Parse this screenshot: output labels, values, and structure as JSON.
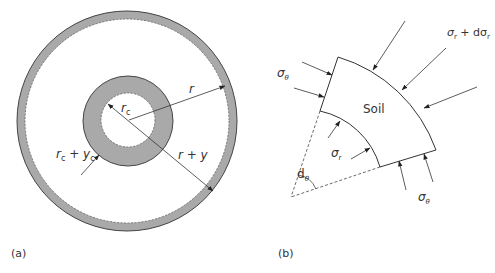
{
  "figure": {
    "panel_a": {
      "caption": "(a)",
      "labels": {
        "r": "r",
        "rc": "r",
        "rc_sub": "c",
        "rc_yc_r": "r",
        "rc_yc_c": "c",
        "rc_yc_plus": " + ",
        "rc_yc_y": "y",
        "rc_yc_c2": "c",
        "r_plus_y": "r + y"
      }
    },
    "panel_b": {
      "caption": "(b)",
      "labels": {
        "soil": "Soil",
        "sigma_theta_left": "σ",
        "sigma_theta_left_sub": "θ",
        "sigma_r": "σ",
        "sigma_r_sub": "r",
        "sigma_r_plus": "σ",
        "sigma_r_plus_sub": "r",
        "sigma_r_plus_mid": " + dσ",
        "sigma_r_plus_sub2": "r",
        "d_theta": "d",
        "d_theta_sub": "θ",
        "sigma_theta_bottom": "σ",
        "sigma_theta_bottom_sub": "θ"
      }
    },
    "colors": {
      "ring_fill": "#a9a9a9",
      "line": "#333333",
      "background": "#ffffff"
    }
  }
}
